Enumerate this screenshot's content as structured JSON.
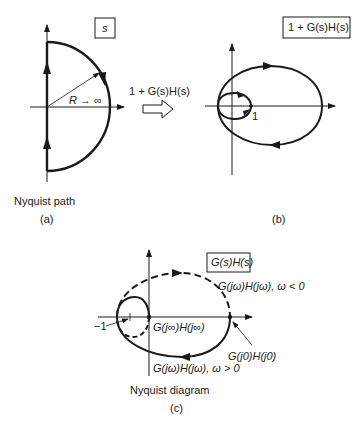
{
  "panel_a": {
    "plane_label": "s",
    "radius_label": "R → ∞",
    "caption": "Nyquist path",
    "tag": "(a)"
  },
  "mapping": {
    "label": "1 + G(s)H(s)",
    "arrow_icon": "hollow-right-arrow"
  },
  "panel_b": {
    "plane_label": "1 + G(s)H(s)",
    "point_label": "1",
    "tag": "(b)"
  },
  "panel_c": {
    "plane_label": "G(s)H(s)",
    "neg_label": "−1",
    "inf_label": "G(j∞)H(j∞)",
    "neg_freq_label": "G(jω)H(jω), ω < 0",
    "zero_label": "G(j0)H(j0)",
    "pos_freq_label": "G(jω)H(jω), ω > 0",
    "caption": "Nyquist diagram",
    "tag": "(c)"
  },
  "colors": {
    "stroke": "#1a1a1a",
    "background": "#ffffff"
  }
}
